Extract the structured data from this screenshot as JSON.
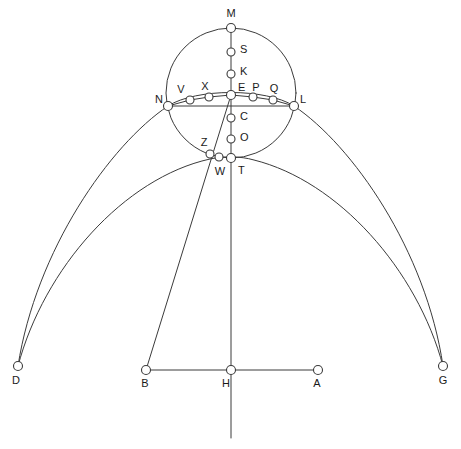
{
  "figure": {
    "canvas": {
      "width": 461,
      "height": 449
    },
    "stroke_color": "#3b3b3b",
    "node_fill_color": "#ffffff",
    "label_color": "#1a1a1a",
    "background_color": "#ffffff"
  },
  "points": [
    {
      "id": "M",
      "label": "M",
      "x": 231,
      "y": 28,
      "r": 4.5,
      "lx": 231,
      "ly": 14,
      "anchor": "middle"
    },
    {
      "id": "S",
      "label": "S",
      "x": 231,
      "y": 52,
      "r": 4.0,
      "lx": 240,
      "ly": 50,
      "anchor": "start"
    },
    {
      "id": "K",
      "label": "K",
      "x": 231,
      "y": 74,
      "r": 4.0,
      "lx": 240,
      "ly": 72,
      "anchor": "start"
    },
    {
      "id": "E",
      "label": "E",
      "x": 231,
      "y": 95,
      "r": 4.5,
      "lx": 238,
      "ly": 88,
      "anchor": "start"
    },
    {
      "id": "C",
      "label": "C",
      "x": 231,
      "y": 118,
      "r": 4.0,
      "lx": 240,
      "ly": 117,
      "anchor": "start"
    },
    {
      "id": "O",
      "label": "O",
      "x": 231,
      "y": 139,
      "r": 4.0,
      "lx": 240,
      "ly": 138,
      "anchor": "start"
    },
    {
      "id": "T",
      "label": "T",
      "x": 231,
      "y": 158,
      "r": 4.5,
      "lx": 238,
      "ly": 171,
      "anchor": "start"
    },
    {
      "id": "W",
      "label": "W",
      "x": 219,
      "y": 157,
      "r": 4.0,
      "lx": 220,
      "ly": 172,
      "anchor": "middle"
    },
    {
      "id": "Z",
      "label": "Z",
      "x": 210,
      "y": 154,
      "r": 4.0,
      "lx": 204,
      "ly": 143,
      "anchor": "middle"
    },
    {
      "id": "N",
      "label": "N",
      "x": 168,
      "y": 106,
      "r": 4.5,
      "lx": 159,
      "ly": 100,
      "anchor": "middle"
    },
    {
      "id": "V",
      "label": "V",
      "x": 190,
      "y": 100,
      "r": 4.0,
      "lx": 181,
      "ly": 90,
      "anchor": "middle"
    },
    {
      "id": "X",
      "label": "X",
      "x": 209,
      "y": 97,
      "r": 4.0,
      "lx": 205,
      "ly": 87,
      "anchor": "middle"
    },
    {
      "id": "P",
      "label": "P",
      "x": 253,
      "y": 97,
      "r": 4.0,
      "lx": 256,
      "ly": 88,
      "anchor": "middle"
    },
    {
      "id": "Q",
      "label": "Q",
      "x": 273,
      "y": 100,
      "r": 4.0,
      "lx": 274,
      "ly": 89,
      "anchor": "middle"
    },
    {
      "id": "L",
      "label": "L",
      "x": 294,
      "y": 106,
      "r": 4.5,
      "lx": 303,
      "ly": 100,
      "anchor": "middle"
    },
    {
      "id": "D",
      "label": "D",
      "x": 18,
      "y": 366,
      "r": 4.5,
      "lx": 16,
      "ly": 381,
      "anchor": "middle"
    },
    {
      "id": "B",
      "label": "B",
      "x": 146,
      "y": 370,
      "r": 4.5,
      "lx": 145,
      "ly": 384,
      "anchor": "middle"
    },
    {
      "id": "H",
      "label": "H",
      "x": 231,
      "y": 370,
      "r": 4.5,
      "lx": 226,
      "ly": 384,
      "anchor": "middle"
    },
    {
      "id": "A",
      "label": "A",
      "x": 318,
      "y": 370,
      "r": 4.5,
      "lx": 317,
      "ly": 384,
      "anchor": "middle"
    },
    {
      "id": "G",
      "label": "G",
      "x": 443,
      "y": 366,
      "r": 4.5,
      "lx": 443,
      "ly": 381,
      "anchor": "middle"
    }
  ],
  "circle": {
    "name": "main-circle",
    "cx": 231,
    "cy": 93,
    "r": 65
  },
  "curves": [
    {
      "id": "outer-arc",
      "name": "outer-arc-D-N-M-L-G",
      "d": "M 18 366 C 36 250 110 145 168 106 C 196 88 266 88 294 106 C 352 145 426 250 443 366"
    },
    {
      "id": "inner-arc",
      "name": "inner-arc-D-Z-T-G",
      "d": "M 18 366 C 44 268 124 178 210 159 C 224 156 240 156 254 160 C 338 181 417 269 443 366"
    }
  ],
  "segments": [
    {
      "id": "vertical-axis",
      "name": "vertical-axis-M-H",
      "x1": 231,
      "y1": 28,
      "x2": 231,
      "y2": 438
    },
    {
      "id": "horizontal-chord",
      "name": "horizontal-chord-N-L",
      "x1": 168,
      "y1": 106,
      "x2": 294,
      "y2": 106
    },
    {
      "id": "baseline",
      "name": "baseline-B-A",
      "x1": 146,
      "y1": 370,
      "x2": 318,
      "y2": 370
    },
    {
      "id": "oblique",
      "name": "oblique-line-E-Z-B",
      "x1": 231,
      "y1": 95,
      "x2": 146,
      "y2": 370
    }
  ],
  "chord_polylines": [
    {
      "id": "left-chord",
      "name": "chord-N-V-X-E",
      "points": "168,106 190,100 209,97 231,95"
    },
    {
      "id": "right-chord",
      "name": "chord-E-P-Q-L",
      "points": "231,95 253,97 273,100 294,106"
    }
  ]
}
